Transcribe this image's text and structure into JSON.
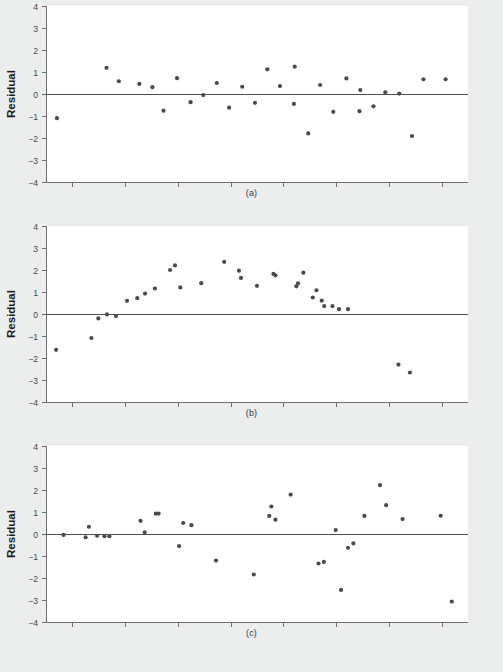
{
  "figure": {
    "background_color": "#eceded",
    "plot_background_color": "#ffffff",
    "dot_color": "#4a4a50",
    "axis_color": "#6e6e72",
    "zero_line_color": "#4d4d52"
  },
  "panels": [
    {
      "id": "a",
      "caption": "(a)",
      "ylabel": "Residual",
      "ytick_labels": [
        "4",
        "3",
        "2",
        "1",
        "0",
        "−1",
        "−2",
        "−3",
        "−4"
      ],
      "n_xticks": 8,
      "chart_data": {
        "type": "scatter",
        "title": "",
        "xlabel": "",
        "ylabel": "Residual",
        "ylim": [
          -4,
          4
        ],
        "xlim": [
          0,
          1
        ],
        "grid": false,
        "legend": "none",
        "yticks": [
          4,
          3,
          2,
          1,
          0,
          -1,
          -2,
          -3,
          -4
        ],
        "reference_line_y": 0,
        "x": [
          0.012,
          0.133,
          0.163,
          0.213,
          0.245,
          0.272,
          0.305,
          0.338,
          0.369,
          0.402,
          0.432,
          0.464,
          0.495,
          0.525,
          0.556,
          0.59,
          0.592,
          0.625,
          0.654,
          0.686,
          0.718,
          0.75,
          0.752,
          0.784,
          0.813,
          0.847,
          0.878,
          0.906,
          0.96
        ],
        "y": [
          -1.1,
          1.19,
          0.58,
          0.46,
          0.31,
          -0.76,
          0.72,
          -0.37,
          -0.05,
          0.5,
          -0.62,
          0.33,
          -0.4,
          1.12,
          0.36,
          -0.45,
          1.24,
          -1.79,
          0.41,
          -0.81,
          0.71,
          -0.78,
          0.18,
          -0.56,
          0.08,
          0.02,
          -1.91,
          0.67,
          0.67
        ]
      }
    },
    {
      "id": "b",
      "caption": "(b)",
      "ylabel": "Residual",
      "ytick_labels": [
        "4",
        "3",
        "2",
        "1",
        "0",
        "−1",
        "−2",
        "−3",
        "−4"
      ],
      "n_xticks": 8,
      "chart_data": {
        "type": "scatter",
        "title": "",
        "xlabel": "",
        "ylabel": "Residual",
        "ylim": [
          -4,
          4
        ],
        "xlim": [
          0,
          1
        ],
        "grid": false,
        "legend": "none",
        "yticks": [
          4,
          3,
          2,
          1,
          0,
          -1,
          -2,
          -3,
          -4
        ],
        "reference_line_y": 0,
        "x": [
          0.01,
          0.096,
          0.113,
          0.134,
          0.156,
          0.183,
          0.208,
          0.227,
          0.251,
          0.288,
          0.3,
          0.313,
          0.364,
          0.42,
          0.456,
          0.461,
          0.5,
          0.54,
          0.545,
          0.596,
          0.6,
          0.613,
          0.636,
          0.645,
          0.658,
          0.664,
          0.684,
          0.7,
          0.722,
          0.845,
          0.873
        ],
        "y": [
          -1.63,
          -1.09,
          -0.2,
          -0.02,
          -0.09,
          0.6,
          0.72,
          0.93,
          1.16,
          2.0,
          2.21,
          1.21,
          1.4,
          2.37,
          1.97,
          1.64,
          1.28,
          1.82,
          1.76,
          1.26,
          1.39,
          1.88,
          0.75,
          1.08,
          0.61,
          0.36,
          0.36,
          0.22,
          0.22,
          -2.3,
          -2.66
        ]
      }
    },
    {
      "id": "c",
      "caption": "(c)",
      "ylabel": "Residual",
      "ytick_labels": [
        "4",
        "3",
        "2",
        "1",
        "0",
        "−1",
        "−2",
        "−3",
        "−4"
      ],
      "n_xticks": 8,
      "chart_data": {
        "type": "scatter",
        "title": "",
        "xlabel": "",
        "ylabel": "Residual",
        "ylim": [
          -4,
          4
        ],
        "xlim": [
          0,
          1
        ],
        "grid": false,
        "legend": "none",
        "yticks": [
          4,
          3,
          2,
          1,
          0,
          -1,
          -2,
          -3,
          -4
        ],
        "reference_line_y": 0,
        "x": [
          0.028,
          0.082,
          0.09,
          0.11,
          0.128,
          0.14,
          0.216,
          0.226,
          0.253,
          0.26,
          0.31,
          0.32,
          0.34,
          0.4,
          0.492,
          0.53,
          0.535,
          0.545,
          0.582,
          0.65,
          0.663,
          0.692,
          0.705,
          0.722,
          0.735,
          0.762,
          0.8,
          0.815,
          0.855,
          0.948,
          0.975
        ],
        "y": [
          -0.04,
          -0.15,
          0.33,
          -0.08,
          -0.1,
          -0.1,
          0.6,
          0.08,
          0.93,
          0.93,
          -0.55,
          0.5,
          0.4,
          -1.21,
          -1.84,
          0.82,
          1.25,
          0.65,
          1.79,
          -1.34,
          -1.27,
          0.18,
          -2.54,
          -0.63,
          -0.43,
          0.82,
          2.22,
          1.31,
          0.68,
          0.83,
          -3.07
        ]
      }
    }
  ]
}
